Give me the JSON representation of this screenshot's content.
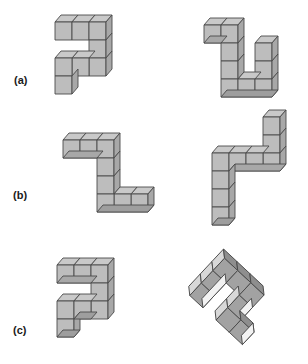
{
  "figure": {
    "title": "",
    "background_color": "#ffffff",
    "width": 308,
    "height": 364,
    "projection": "isometric-cabinet",
    "cube_colors": {
      "top_face": "#c9c9c9",
      "front_face": "#bdbdbd",
      "side_face": "#a8a8a8",
      "edge_stroke": "#4a4a4a",
      "rotated_top_face": "#d8d8d8",
      "rotated_front_face": "#a2a2a2",
      "rotated_side_face": "#8e8e8e",
      "highlight_face": "#f2f2f2"
    },
    "labels": [
      {
        "id": "a",
        "text": "(a)"
      },
      {
        "id": "b",
        "text": "(b)"
      },
      {
        "id": "c",
        "text": "(c)"
      }
    ],
    "rows": [
      {
        "label": "(a)",
        "left_shape": {
          "name": "left-solid-a",
          "description": "Z/S shaped polycube: top row of three cubes, column down at right, bottom row of three cubes extending left, plus one cube below at far left",
          "cubes": [
            [
              0,
              2,
              0
            ],
            [
              1,
              2,
              0
            ],
            [
              2,
              2,
              0
            ],
            [
              2,
              1,
              0
            ],
            [
              2,
              0,
              0
            ],
            [
              1,
              0,
              0
            ],
            [
              0,
              0,
              0
            ],
            [
              0,
              -1,
              0
            ]
          ]
        },
        "right_shape": {
          "name": "right-solid-a",
          "description": "U shaped polycube: short top arm of two cubes at upper left, tall column of three, bottom row of three, right column of three rising",
          "cubes": [
            [
              0,
              3,
              0
            ],
            [
              1,
              3,
              0
            ],
            [
              1,
              2,
              0
            ],
            [
              1,
              1,
              0
            ],
            [
              1,
              0,
              0
            ],
            [
              2,
              0,
              0
            ],
            [
              3,
              0,
              0
            ],
            [
              3,
              1,
              0
            ],
            [
              3,
              2,
              0
            ]
          ]
        }
      },
      {
        "label": "(b)",
        "left_shape": {
          "name": "left-solid-b",
          "description": "Z shaped polycube: top row of three cubes, column descending at right, bottom row of three extending right",
          "cubes": [
            [
              0,
              3,
              0
            ],
            [
              1,
              3,
              0
            ],
            [
              2,
              3,
              0
            ],
            [
              2,
              2,
              0
            ],
            [
              2,
              1,
              0
            ],
            [
              2,
              0,
              0
            ],
            [
              3,
              0,
              0
            ],
            [
              4,
              0,
              0
            ]
          ]
        },
        "right_shape": {
          "name": "right-solid-b",
          "description": "Mirrored Z: tall column of three at top right, horizontal row of four, column of three descending at left",
          "cubes": [
            [
              3,
              5,
              0
            ],
            [
              3,
              4,
              0
            ],
            [
              3,
              3,
              0
            ],
            [
              0,
              3,
              0
            ],
            [
              1,
              3,
              0
            ],
            [
              2,
              3,
              0
            ],
            [
              0,
              2,
              0
            ],
            [
              0,
              1,
              0
            ],
            [
              0,
              0,
              0
            ]
          ]
        }
      },
      {
        "label": "(c)",
        "left_shape": {
          "name": "left-solid-c",
          "description": "Z shaped polycube upright: top row of three, right column descending three, bottom row of two left, one cube below",
          "cubes": [
            [
              0,
              3,
              0
            ],
            [
              1,
              3,
              0
            ],
            [
              2,
              3,
              0
            ],
            [
              2,
              2,
              0
            ],
            [
              2,
              1,
              0
            ],
            [
              0,
              1,
              0
            ],
            [
              1,
              1,
              0
            ],
            [
              0,
              0,
              0
            ]
          ]
        },
        "right_shape": {
          "name": "right-solid-c",
          "description": "Same Z shape rotated about 45 degrees, viewed edge-on with diamond faces",
          "rotation_degrees": 45,
          "cubes": [
            [
              0,
              3,
              0
            ],
            [
              1,
              3,
              0
            ],
            [
              2,
              3,
              0
            ],
            [
              2,
              2,
              0
            ],
            [
              2,
              1,
              0
            ],
            [
              0,
              1,
              0
            ],
            [
              1,
              1,
              0
            ],
            [
              0,
              0,
              0
            ]
          ]
        }
      }
    ]
  }
}
